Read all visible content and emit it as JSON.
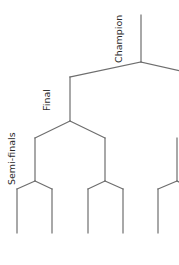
{
  "diagram": {
    "type": "tournament-bracket",
    "orientation": "root-top",
    "line_color": "#6e6e6e",
    "text_color": "#2b2b2b",
    "background": "#ffffff",
    "round_labels": {
      "champion": "Champion",
      "final": "Final",
      "semi_finals": "Semi-finals"
    },
    "nodes": [
      {
        "id": "champion",
        "x": 141,
        "y": 62,
        "top": 15
      },
      {
        "id": "final-left",
        "x": 70,
        "y": 121,
        "top": 77
      },
      {
        "id": "semi-1",
        "x": 35,
        "y": 181,
        "top": 138
      },
      {
        "id": "semi-2",
        "x": 105,
        "y": 181,
        "top": 138
      },
      {
        "id": "semi-3",
        "x": 177,
        "y": 181,
        "top": 138
      }
    ],
    "leaves": [
      {
        "x": 17,
        "top": 189,
        "bottom": 233
      },
      {
        "x": 52,
        "top": 189,
        "bottom": 233
      },
      {
        "x": 88,
        "top": 189,
        "bottom": 233
      },
      {
        "x": 123,
        "top": 189,
        "bottom": 233
      },
      {
        "x": 158,
        "top": 189,
        "bottom": 233
      }
    ]
  }
}
